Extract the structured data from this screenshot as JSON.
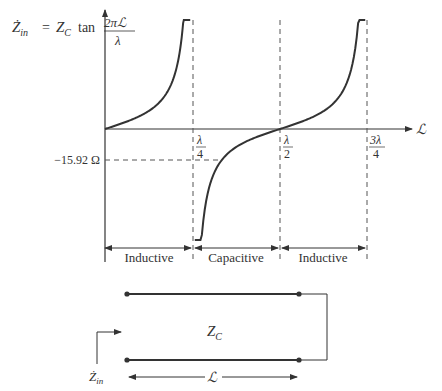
{
  "equation": {
    "lhs_main": "Ż",
    "lhs_sub": "in",
    "equals": "=",
    "zc_main": "Z",
    "zc_sub": "C",
    "func": "tan",
    "frac_num": "2πℒ",
    "frac_den": "λ"
  },
  "axes": {
    "x_label": "ℒ",
    "ticks": [
      {
        "num": "λ",
        "den": "4"
      },
      {
        "num": "λ",
        "den": "2"
      },
      {
        "num": "3λ",
        "den": "4"
      }
    ],
    "y_marker_label": "−15.92 Ω",
    "y_marker_value_ohm": -15.92
  },
  "regions": [
    {
      "label": "Inductive"
    },
    {
      "label": "Capacitive"
    },
    {
      "label": "Inductive"
    }
  ],
  "circuit": {
    "zc_main": "Z",
    "zc_sub": "C",
    "zin_main": "Ż",
    "zin_sub": "in",
    "length_label": "ℒ"
  },
  "colors": {
    "line": "#333333",
    "dashed": "#555555"
  }
}
